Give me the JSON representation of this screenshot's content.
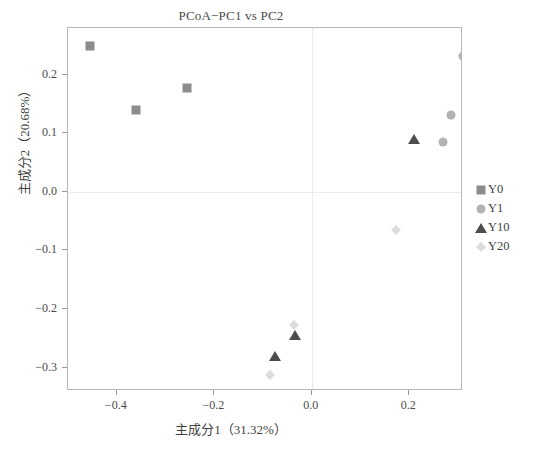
{
  "chart_data": {
    "type": "scatter",
    "title": "PCoA−PC1 vs PC2",
    "xlabel": "主成分1（31.32%）",
    "ylabel": "主成分2（20.68%）",
    "xlim": [
      -0.5,
      0.31
    ],
    "ylim": [
      -0.34,
      0.28
    ],
    "xticks": [
      -0.4,
      -0.2,
      0.0,
      0.2
    ],
    "xticklabels": [
      "−0.4",
      "−0.2",
      "0.0",
      "0.2"
    ],
    "yticks": [
      0.2,
      0.1,
      0.0,
      -0.1,
      -0.2,
      -0.3
    ],
    "yticklabels": [
      "0.2",
      "0.1",
      "0.0",
      "−0.1",
      "−0.2",
      "−0.3"
    ],
    "grid": false,
    "reference_lines": {
      "x": 0.0,
      "y": 0.0
    },
    "legend_position": "right",
    "series": [
      {
        "name": "Y0",
        "marker": "square",
        "color": "#8c8c8c",
        "points": [
          {
            "x": -0.455,
            "y": 0.25
          },
          {
            "x": -0.36,
            "y": 0.14
          },
          {
            "x": -0.255,
            "y": 0.178
          }
        ]
      },
      {
        "name": "Y1",
        "marker": "circle",
        "color": "#b2b2b2",
        "points": [
          {
            "x": 0.31,
            "y": 0.233
          },
          {
            "x": 0.285,
            "y": 0.132
          },
          {
            "x": 0.27,
            "y": 0.085
          }
        ]
      },
      {
        "name": "Y10",
        "marker": "triangle",
        "color": "#4d4d4d",
        "points": [
          {
            "x": 0.21,
            "y": 0.091
          },
          {
            "x": -0.075,
            "y": -0.28
          },
          {
            "x": -0.035,
            "y": -0.245
          }
        ]
      },
      {
        "name": "Y20",
        "marker": "diamond",
        "color": "#dcdcdc",
        "points": [
          {
            "x": 0.173,
            "y": -0.065
          },
          {
            "x": -0.037,
            "y": -0.227
          },
          {
            "x": -0.085,
            "y": -0.312
          }
        ]
      }
    ]
  }
}
